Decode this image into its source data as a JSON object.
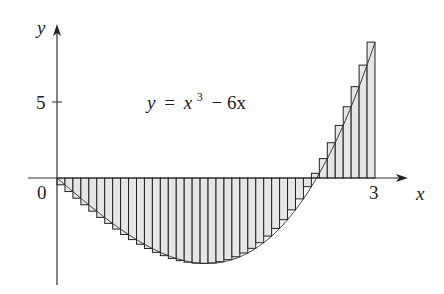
{
  "chart_data": {
    "type": "bar",
    "title": "",
    "equation": "y = x^3 - 6x",
    "equation_label": {
      "y": "y",
      "eq": "=",
      "x": "x",
      "exp": "3",
      "rest": "− 6x"
    },
    "xlabel": "x",
    "ylabel": "y",
    "x_ticks": [
      {
        "value": 0,
        "label": "0"
      },
      {
        "value": 3,
        "label": "3"
      }
    ],
    "y_ticks": [
      {
        "value": 5,
        "label": "5"
      }
    ],
    "xlim": [
      0,
      3
    ],
    "ylim": [
      -6.5,
      9.5
    ],
    "method": "right-endpoint Riemann sum",
    "n": 40,
    "dx": 0.075,
    "colors": {
      "fill": "#e6e6e6",
      "stroke": "#222222",
      "axis": "#333333"
    }
  }
}
